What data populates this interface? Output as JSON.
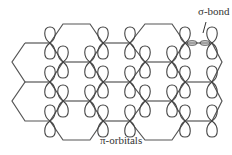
{
  "diagram": {
    "labels": {
      "sigma_bond": "σ-bond",
      "pi_orbitals": "π-orbitals"
    },
    "colors": {
      "line": "#555555",
      "text": "#333333",
      "background": "#ffffff"
    },
    "lattice": {
      "type": "honeycomb",
      "edge_length_px": 27,
      "orientation": "flat-top"
    }
  }
}
